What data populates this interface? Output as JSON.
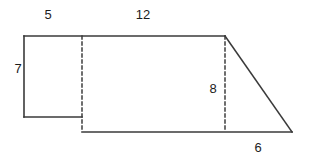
{
  "figure": {
    "kind": "composite-polygon-diagram",
    "canvas": {
      "width": 310,
      "height": 162
    },
    "colors": {
      "background": "#ffffff",
      "stroke": "#3a3a3a",
      "dashed_stroke": "#4a4a4a",
      "label_text": "#1c1c1c"
    },
    "stroke_width": 1.6,
    "dash_pattern": "3,3",
    "labels": [
      {
        "id": "label-5",
        "text": "5",
        "x": 48,
        "y": 14,
        "describes": "top edge of left rectangle"
      },
      {
        "id": "label-12",
        "text": "12",
        "x": 143,
        "y": 14,
        "describes": "top edge of large rectangle"
      },
      {
        "id": "label-7",
        "text": "7",
        "x": 18,
        "y": 68,
        "describes": "left vertical side of left rectangle"
      },
      {
        "id": "label-8",
        "text": "8",
        "x": 213,
        "y": 88,
        "describes": "right vertical dashed height of large rectangle"
      },
      {
        "id": "label-6",
        "text": "6",
        "x": 258,
        "y": 147,
        "describes": "base of right triangle"
      }
    ],
    "solid_segments": [
      {
        "id": "top-edge",
        "x1": 24,
        "y1": 36,
        "x2": 225,
        "y2": 36
      },
      {
        "id": "left-vertical-edge",
        "x1": 24,
        "y1": 36,
        "x2": 24,
        "y2": 117
      },
      {
        "id": "left-bottom-edge",
        "x1": 24,
        "y1": 117,
        "x2": 82,
        "y2": 117
      },
      {
        "id": "main-bottom-edge",
        "x1": 82,
        "y1": 132,
        "x2": 292,
        "y2": 132
      },
      {
        "id": "triangle-hypotenuse",
        "x1": 225,
        "y1": 36,
        "x2": 292,
        "y2": 132
      }
    ],
    "dashed_segments": [
      {
        "id": "divider-left-rect",
        "x1": 82,
        "y1": 36,
        "x2": 82,
        "y2": 132
      },
      {
        "id": "divider-triangle",
        "x1": 225,
        "y1": 36,
        "x2": 225,
        "y2": 132
      }
    ],
    "dimensions": {
      "left_rect_top": "5",
      "left_rect_height": "7",
      "large_rect_top": "12",
      "large_rect_height": "8",
      "triangle_base": "6"
    }
  }
}
